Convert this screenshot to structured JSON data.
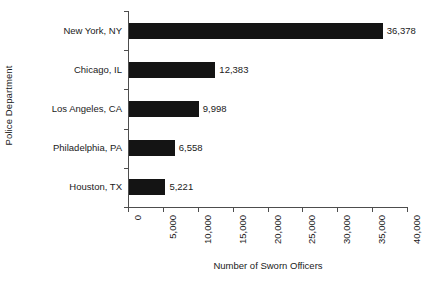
{
  "chart_data": {
    "type": "bar",
    "orientation": "horizontal",
    "title": "",
    "xlabel": "Number of Sworn Officers",
    "ylabel": "Police Department",
    "categories": [
      "New York, NY",
      "Chicago, IL",
      "Los Angeles, CA",
      "Philadelphia, PA",
      "Houston, TX"
    ],
    "values": [
      36378,
      12383,
      9998,
      6558,
      5221
    ],
    "value_labels": [
      "36,378",
      "12,383",
      "9,998",
      "6,558",
      "5,221"
    ],
    "xlim": [
      0,
      40000
    ],
    "xticks": [
      0,
      5000,
      10000,
      15000,
      20000,
      25000,
      30000,
      35000,
      40000
    ],
    "xtick_labels": [
      "0",
      "5,000",
      "10,000",
      "15,000",
      "20,000",
      "25,000",
      "30,000",
      "35,000",
      "40,000"
    ],
    "xtick_label_rotation": -90,
    "grid": false,
    "legend": false,
    "bar_color": "#141414",
    "axis_color": "#4d4d4d",
    "background_color": "#ffffff",
    "text_color": "#1a1a1a"
  }
}
